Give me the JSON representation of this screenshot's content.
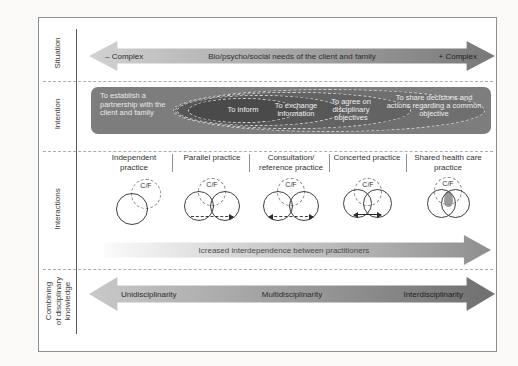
{
  "sidebar": {
    "situation": "Situation",
    "intention": "Intention",
    "interactions": "Interactions",
    "combining": "Combining\nof disciplinary\nknowledge"
  },
  "situation": {
    "left_label": "– Complex",
    "center_label": "Bio/psycho/social needs of the client and family",
    "right_label": "+ Complex"
  },
  "intention": {
    "partnership": "To establish a partnership with the client and family",
    "ovals": [
      "To inform",
      "To exchange information",
      "To agree on disciplinary objectives",
      "To share decisions and actions regarding a common objective"
    ]
  },
  "interactions": {
    "practices": [
      "Independent practice",
      "Parallel practice",
      "Consultation/ reference practice",
      "Concerted practice",
      "Shared health care practice"
    ],
    "circle_label": "C/F",
    "arrow_label": "Icreased interdependence between practitioners"
  },
  "combining": {
    "left_label": "Unidisciplinarity",
    "center_label": "Multidisciplinarity",
    "right_label": "Interdisciplinarity"
  },
  "colors": {
    "figure_border": "#8f8f8f",
    "situation_arrow_start": "#d2d2d2",
    "situation_arrow_end": "#787878",
    "intention_panel": "#7d7d7d",
    "oval_fills": [
      "#6f6f6f",
      "#636363",
      "#575757",
      "#4a4a4a"
    ],
    "oval_border": "#cfcfcf",
    "interdependence_arrow_end": "#8e8e8e",
    "combining_arrow_start": "#c9c9c9",
    "combining_arrow_end": "#6f6f6f",
    "text_dark": "#2d2d2d",
    "text_light": "#efefef"
  }
}
